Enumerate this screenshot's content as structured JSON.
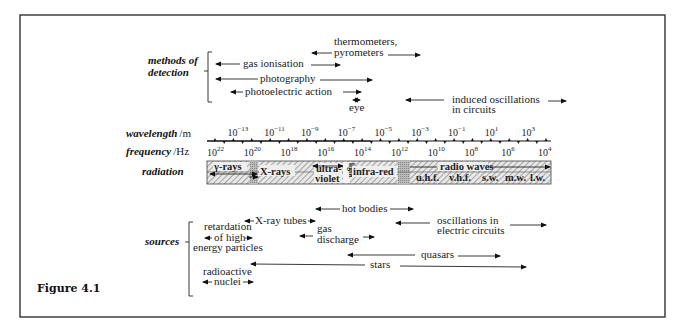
{
  "figure": {
    "caption": "Figure 4.1"
  },
  "detection": {
    "label_line1": "methods of",
    "label_line2": "detection",
    "items": [
      {
        "id": "thermometers",
        "line1": "thermometers,",
        "line2": "pyrometers"
      },
      {
        "id": "gas-ionisation",
        "text": "gas ionisation"
      },
      {
        "id": "photography",
        "text": "photography"
      },
      {
        "id": "photoelectric",
        "text": "photoelectric action"
      },
      {
        "id": "eye",
        "text": "eye"
      },
      {
        "id": "induced",
        "line1": "induced oscillations",
        "line2": "in circuits"
      }
    ]
  },
  "axes": {
    "wavelength_label": "wavelength",
    "wavelength_unit": "m",
    "frequency_label": "frequency",
    "frequency_unit": "Hz",
    "wavelength_ticks": [
      {
        "base": "10",
        "exp": "−13"
      },
      {
        "base": "10",
        "exp": "−11"
      },
      {
        "base": "10",
        "exp": "−9"
      },
      {
        "base": "10",
        "exp": "−7"
      },
      {
        "base": "10",
        "exp": "−5"
      },
      {
        "base": "10",
        "exp": "−3"
      },
      {
        "base": "10",
        "exp": "−1"
      },
      {
        "base": "10",
        "exp": "1"
      },
      {
        "base": "10",
        "exp": "3"
      }
    ],
    "frequency_ticks": [
      {
        "base": "10",
        "exp": "22"
      },
      {
        "base": "10",
        "exp": "20"
      },
      {
        "base": "10",
        "exp": "18"
      },
      {
        "base": "10",
        "exp": "16"
      },
      {
        "base": "10",
        "exp": "14"
      },
      {
        "base": "10",
        "exp": "12"
      },
      {
        "base": "10",
        "exp": "10"
      },
      {
        "base": "10",
        "exp": "8"
      },
      {
        "base": "10",
        "exp": "6"
      },
      {
        "base": "10",
        "exp": "4"
      }
    ]
  },
  "radiation": {
    "label": "radiation",
    "bands": {
      "gamma": "γ-rays",
      "xrays": "X-rays",
      "uv_line1": "ultra-",
      "uv_line2": "violet",
      "light": "light",
      "infrared": "infra-red",
      "radio": "radio waves",
      "uhf": "u.h.f.",
      "vhf": "v.h.f.",
      "sw": "s.w.",
      "mw": "m.w.",
      "lw": "l.w."
    }
  },
  "sources": {
    "label": "sources",
    "items": [
      {
        "id": "hot-bodies",
        "text": "hot bodies"
      },
      {
        "id": "xray-tubes",
        "text": "X-ray tubes"
      },
      {
        "id": "retardation",
        "line1": "retardation",
        "line2": "of high",
        "line3": "energy particles"
      },
      {
        "id": "gas-discharge",
        "line1": "gas",
        "line2": "discharge"
      },
      {
        "id": "oscillations",
        "line1": "oscillations in",
        "line2": "electric circuits"
      },
      {
        "id": "quasars",
        "text": "quasars"
      },
      {
        "id": "stars",
        "text": "stars"
      },
      {
        "id": "radioactive",
        "line1": "radioactive",
        "line2": "nuclei"
      }
    ]
  }
}
